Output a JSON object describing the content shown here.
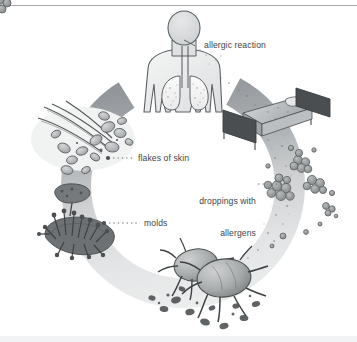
{
  "figure": {
    "background_color": "#ffffff",
    "rule_color": "#a9acae",
    "label_color": "#3d4447",
    "ring_color_light": "#e8e9ea",
    "ring_color_dark": "#8f9295"
  },
  "labels": {
    "allergic_reaction": "allergic reaction",
    "flakes_of_skin": "flakes of skin",
    "droppings_line1": "droppings with",
    "droppings_line2": "allergens",
    "molds": "molds"
  },
  "illustrations": {
    "human": "human-head-and-lungs-illustration",
    "bed": "bed-illustration",
    "hair_flakes": "hair-with-skin-flakes-illustration",
    "mold": "mold-colony-illustration",
    "mites": "dust-mites-illustration",
    "droppings": "droppings-clusters-illustration",
    "ring": "cycle-ring-arrow"
  },
  "leaders": {
    "flakes_dots": "dotted-leader-line",
    "droppings_dots": "dotted-leader-line",
    "molds_dots": "dotted-leader-line"
  }
}
